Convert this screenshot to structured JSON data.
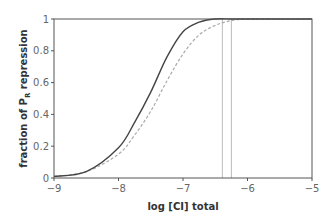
{
  "chart_data": {
    "type": "line",
    "title": "",
    "xlabel": "log [CI] total",
    "ylabel_parts": {
      "pre": "fraction of P",
      "sub": "R",
      "post": " repression"
    },
    "ylabel": "fraction of P_R repression",
    "xlim": [
      -9,
      -5
    ],
    "ylim": [
      0,
      1
    ],
    "x_ticks": [
      -9,
      -8,
      -7,
      -6,
      -5
    ],
    "x_tick_labels": [
      "−9",
      "−8",
      "−7",
      "−6",
      "−5"
    ],
    "y_ticks": [
      0,
      0.2,
      0.4,
      0.6,
      0.8,
      1
    ],
    "y_tick_labels": [
      "0",
      "0.2",
      "0.4",
      "0.6",
      "0.8",
      "1"
    ],
    "grid": false,
    "legend": null,
    "series": [
      {
        "name": "solid",
        "style": "solid",
        "color": "#444444",
        "x": [
          -9,
          -8.5,
          -8,
          -7.75,
          -7.5,
          -7.25,
          -7,
          -6.75,
          -6.5,
          -6.25,
          -6,
          -5.5,
          -5
        ],
        "y": [
          0.01,
          0.04,
          0.19,
          0.35,
          0.54,
          0.76,
          0.92,
          0.98,
          1.0,
          1.0,
          1.0,
          1.0,
          1.0
        ]
      },
      {
        "name": "dashed",
        "style": "dashed",
        "color": "#aaaaaa",
        "x": [
          -9,
          -8.5,
          -8,
          -7.75,
          -7.5,
          -7.25,
          -7,
          -6.75,
          -6.5,
          -6.25,
          -6,
          -5.5,
          -5
        ],
        "y": [
          0.01,
          0.04,
          0.15,
          0.27,
          0.42,
          0.61,
          0.78,
          0.9,
          0.96,
          0.99,
          1.0,
          1.0,
          1.0
        ]
      }
    ],
    "vertical_lines": [
      -6.39,
      -6.25
    ]
  }
}
